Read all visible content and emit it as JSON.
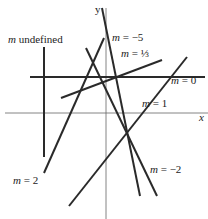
{
  "diagram": {
    "axes": {
      "x_label": "x",
      "y_label": "y",
      "color": "#555555"
    },
    "line_color": "#2a2a2a",
    "lines": [
      {
        "id": "m-undefined",
        "label_var": "m",
        "label_rest": " undefined",
        "x1": 44,
        "y1": 47,
        "x2": 44,
        "y2": 157,
        "label_x": 8,
        "label_y": 43
      },
      {
        "id": "m-neg5",
        "label_var": "m",
        "label_rest": " = −5",
        "x1": 102,
        "y1": 8,
        "x2": 140,
        "y2": 196,
        "label_x": 112,
        "label_y": 41
      },
      {
        "id": "m-one-third",
        "label_var": "m",
        "label_rest": " = ⅓",
        "x1": 61,
        "y1": 98,
        "x2": 162,
        "y2": 60,
        "label_x": 121,
        "label_y": 57
      },
      {
        "id": "m-0",
        "label_var": "m",
        "label_rest": " = 0",
        "x1": 30,
        "y1": 77,
        "x2": 205,
        "y2": 77,
        "label_x": 171,
        "label_y": 84
      },
      {
        "id": "m-1",
        "label_var": "m",
        "label_rest": " = 1",
        "x1": 69,
        "y1": 206,
        "x2": 187,
        "y2": 57,
        "label_x": 142,
        "label_y": 107
      },
      {
        "id": "m-2",
        "label_var": "m",
        "label_rest": " = 2",
        "x1": 44,
        "y1": 173,
        "x2": 104,
        "y2": 38,
        "label_x": 13,
        "label_y": 184
      },
      {
        "id": "m-neg2",
        "label_var": "m",
        "label_rest": " = −2",
        "x1": 86,
        "y1": 48,
        "x2": 157,
        "y2": 196,
        "label_x": 150,
        "label_y": 173
      }
    ]
  }
}
